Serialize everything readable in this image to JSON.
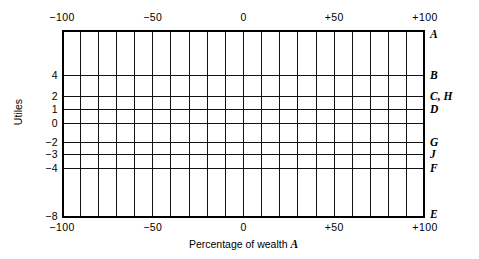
{
  "chart_data": {
    "type": "line",
    "title": "",
    "subtitle": "",
    "xlabel_text": "Percentage of wealth",
    "xlabel_symbol": "A",
    "ylabel": "Utiles",
    "xlim": [
      -100,
      100
    ],
    "ylim": [
      -8,
      6
    ],
    "grid": true,
    "legend_position": "right-axis",
    "x_major_ticks": [
      {
        "value": -100,
        "label": "−100"
      },
      {
        "value": -50,
        "label": "−50"
      },
      {
        "value": 0,
        "label": "0"
      },
      {
        "value": 50,
        "label": "+50"
      },
      {
        "value": 100,
        "label": "+100"
      }
    ],
    "x_gridline_values": [
      -100,
      -90,
      -80,
      -70,
      -60,
      -50,
      -40,
      -30,
      -20,
      -10,
      0,
      10,
      20,
      30,
      40,
      50,
      60,
      70,
      80,
      90,
      100
    ],
    "x_gridline_positions_px": [
      0,
      18.15,
      36.3,
      54.45,
      72.6,
      90.75,
      108.9,
      127.05,
      145.2,
      163.35,
      181.5,
      199.65,
      217.8,
      235.95,
      254.1,
      272.25,
      290.4,
      308.55,
      326.7,
      344.85,
      363
    ],
    "y_ticks": [
      {
        "value": 4,
        "label": "4",
        "pos_px": 45
      },
      {
        "value": 2,
        "label": "2",
        "pos_px": 66
      },
      {
        "value": 1,
        "label": "1",
        "pos_px": 79
      },
      {
        "value": 0,
        "label": "0",
        "pos_px": 93
      },
      {
        "value": -2,
        "label": "−2",
        "pos_px": 112
      },
      {
        "value": -3,
        "label": "−3",
        "pos_px": 124
      },
      {
        "value": -4,
        "label": "−4",
        "pos_px": 138
      },
      {
        "value": -8,
        "label": "−8",
        "pos_px": 186
      }
    ],
    "y_gridline_positions_px": [
      45,
      66,
      79,
      93,
      112,
      124,
      138
    ],
    "series": [
      {
        "name": "A",
        "label": "A",
        "utiles": 6,
        "pos_px": 4
      },
      {
        "name": "B",
        "label": "B",
        "utiles": 4,
        "pos_px": 45
      },
      {
        "name": "C, H",
        "label": "C, H",
        "utiles": 2,
        "pos_px": 66
      },
      {
        "name": "D",
        "label": "D",
        "utiles": 1,
        "pos_px": 79
      },
      {
        "name": "G",
        "label": "G",
        "utiles": -2,
        "pos_px": 112
      },
      {
        "name": "J",
        "label": "J",
        "utiles": -3,
        "pos_px": 124
      },
      {
        "name": "F",
        "label": "F",
        "utiles": -4,
        "pos_px": 138
      },
      {
        "name": "E",
        "label": "E",
        "utiles": -8,
        "pos_px": 184
      }
    ],
    "colors": {
      "axis": "#000000",
      "grid": "#111111",
      "background": "#ffffff"
    }
  }
}
